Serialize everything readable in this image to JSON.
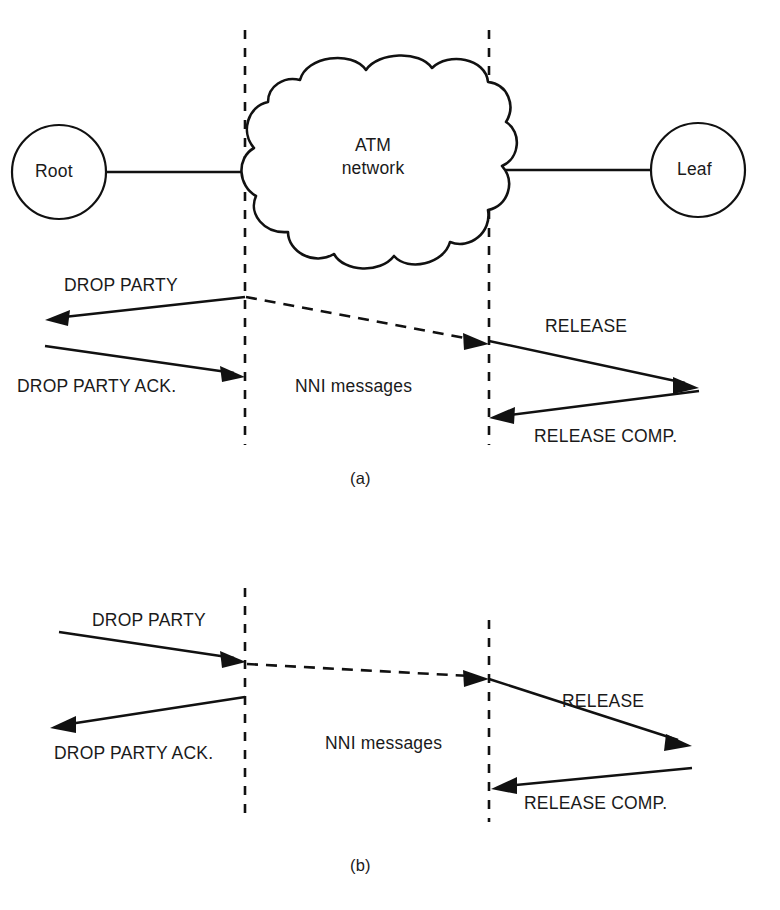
{
  "figure": {
    "colors": {
      "ink": "#111111",
      "paper": "#ffffff"
    },
    "captions": [
      {
        "id": "caption-a",
        "label": "(a)"
      },
      {
        "id": "caption-b",
        "label": "(b)"
      }
    ]
  },
  "panel_a": {
    "caption": "(a)",
    "nodes": [
      {
        "id": "root",
        "label": "Root"
      },
      {
        "id": "leaf",
        "label": "Leaf"
      }
    ],
    "cloud": {
      "label_line1": "ATM",
      "label_line2": "network"
    },
    "boundaries": [
      {
        "id": "left-uni-boundary"
      },
      {
        "id": "right-uni-boundary"
      }
    ],
    "messages": [
      {
        "id": "drop-party",
        "label": "DROP PARTY",
        "direction": "right-to-left",
        "style": "solid"
      },
      {
        "id": "drop-party-ack",
        "label": "DROP PARTY ACK.",
        "direction": "left-to-right",
        "style": "solid"
      },
      {
        "id": "nni-messages",
        "label": "NNI messages",
        "direction": "left-to-right",
        "style": "dashed"
      },
      {
        "id": "release",
        "label": "RELEASE",
        "direction": "left-to-right",
        "style": "solid"
      },
      {
        "id": "release-comp",
        "label": "RELEASE COMP.",
        "direction": "right-to-left",
        "style": "solid"
      }
    ]
  },
  "panel_b": {
    "caption": "(b)",
    "boundaries": [
      {
        "id": "left-uni-boundary"
      },
      {
        "id": "right-uni-boundary"
      }
    ],
    "messages": [
      {
        "id": "drop-party",
        "label": "DROP PARTY",
        "direction": "left-to-right",
        "style": "solid"
      },
      {
        "id": "drop-party-ack",
        "label": "DROP PARTY ACK.",
        "direction": "right-to-left",
        "style": "solid"
      },
      {
        "id": "nni-messages",
        "label": "NNI messages",
        "direction": "left-to-right",
        "style": "dashed"
      },
      {
        "id": "release",
        "label": "RELEASE",
        "direction": "left-to-right",
        "style": "solid"
      },
      {
        "id": "release-comp",
        "label": "RELEASE COMP.",
        "direction": "right-to-left",
        "style": "solid"
      }
    ]
  }
}
